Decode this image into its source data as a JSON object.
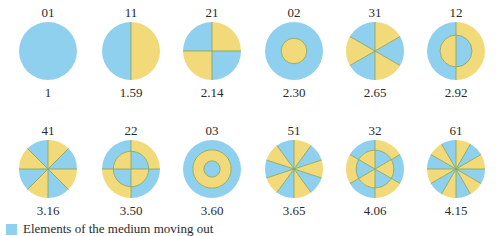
{
  "colors": {
    "out": "#8fd0ef",
    "in": "#f2da7a",
    "line": "#8aa95a"
  },
  "modes": [
    {
      "id": "01",
      "ratio": "1",
      "m": 0,
      "n": 1,
      "inner": []
    },
    {
      "id": "11",
      "ratio": "1.59",
      "m": 1,
      "n": 1,
      "inner": []
    },
    {
      "id": "21",
      "ratio": "2.14",
      "m": 2,
      "n": 1,
      "inner": []
    },
    {
      "id": "02",
      "ratio": "2.30",
      "m": 0,
      "n": 2,
      "inner": [
        0.44
      ]
    },
    {
      "id": "31",
      "ratio": "2.65",
      "m": 3,
      "n": 1,
      "inner": []
    },
    {
      "id": "12",
      "ratio": "2.92",
      "m": 1,
      "n": 2,
      "inner": [
        0.55
      ]
    },
    {
      "id": "41",
      "ratio": "3.16",
      "m": 4,
      "n": 1,
      "inner": []
    },
    {
      "id": "22",
      "ratio": "3.50",
      "m": 2,
      "n": 2,
      "inner": [
        0.61
      ]
    },
    {
      "id": "03",
      "ratio": "3.60",
      "m": 0,
      "n": 3,
      "inner": [
        0.66,
        0.28
      ]
    },
    {
      "id": "51",
      "ratio": "3.65",
      "m": 5,
      "n": 1,
      "inner": []
    },
    {
      "id": "32",
      "ratio": "4.06",
      "m": 3,
      "n": 2,
      "inner": [
        0.65
      ]
    },
    {
      "id": "61",
      "ratio": "4.15",
      "m": 6,
      "n": 1,
      "inner": []
    }
  ],
  "legend": {
    "label": "Elements of the medium moving out"
  }
}
